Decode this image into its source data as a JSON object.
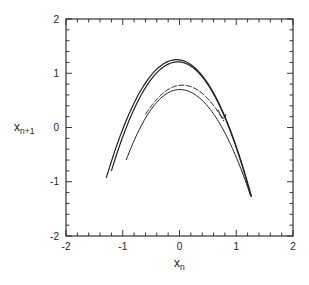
{
  "chart_data": {
    "type": "scatter",
    "title": "",
    "xlabel": "x_n",
    "ylabel": "x_{n+1}",
    "xlabel_main": "x",
    "xlabel_sub": "n",
    "ylabel_main": "x",
    "ylabel_sub": "n+1",
    "xlim": [
      -2,
      2
    ],
    "ylim": [
      -2,
      2
    ],
    "xticks": [
      -2,
      -1,
      0,
      1,
      2
    ],
    "yticks": [
      -2,
      -1,
      0,
      1,
      2
    ],
    "xtick_labels": [
      "-2",
      "-1",
      "0",
      "1",
      "2"
    ],
    "ytick_labels": [
      "-2",
      "-1",
      "0",
      "1",
      "2"
    ],
    "minor_tick_step": 0.2,
    "grid": false,
    "legend": null,
    "series": [
      {
        "name": "outer fold 1",
        "x_range": [
          -1.29,
          1.27
        ],
        "vertex": [
          -0.05,
          1.25
        ],
        "endpoints": [
          [
            -1.29,
            -0.93
          ],
          [
            1.27,
            -1.28
          ]
        ]
      },
      {
        "name": "outer fold 2",
        "x_range": [
          -1.2,
          1.26
        ],
        "vertex": [
          -0.03,
          1.21
        ],
        "endpoints": [
          [
            -1.2,
            -0.8
          ],
          [
            1.26,
            -1.27
          ]
        ]
      },
      {
        "name": "inner fold 1",
        "x_range": [
          -0.6,
          0.78
        ],
        "vertex": [
          0.05,
          0.78
        ],
        "endpoints": [
          [
            -0.6,
            0.24
          ],
          [
            0.78,
            0.12
          ]
        ]
      },
      {
        "name": "inner fold 2",
        "x_range": [
          -0.94,
          1.25
        ],
        "vertex": [
          0.0,
          0.7
        ],
        "endpoints": [
          [
            -0.94,
            -0.6
          ],
          [
            1.25,
            -1.25
          ]
        ]
      }
    ]
  }
}
